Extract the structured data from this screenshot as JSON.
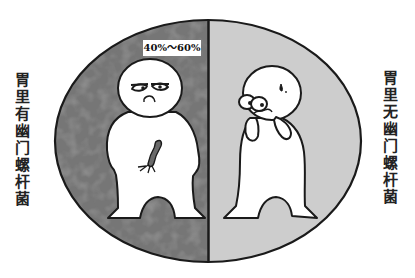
{
  "figure": {
    "type": "comparison-illustration",
    "left_panel": {
      "label_chars": [
        "胃",
        "里",
        "有",
        "幽",
        "门",
        "螺",
        "杆",
        "菌"
      ],
      "label": "胃里有幽门螺杆菌",
      "percentage_badge": "40%～60%",
      "background_color": "#7a7a7a",
      "character": "sad-person-with-bacterium"
    },
    "right_panel": {
      "label_chars": [
        "胃",
        "里",
        "无",
        "幽",
        "门",
        "螺",
        "杆",
        "菌"
      ],
      "label": "胃里无幽门螺杆菌",
      "background_color": "#cfcfcf",
      "character": "worried-person-hands-on-face"
    },
    "outline_color": "#1a1a1a"
  }
}
